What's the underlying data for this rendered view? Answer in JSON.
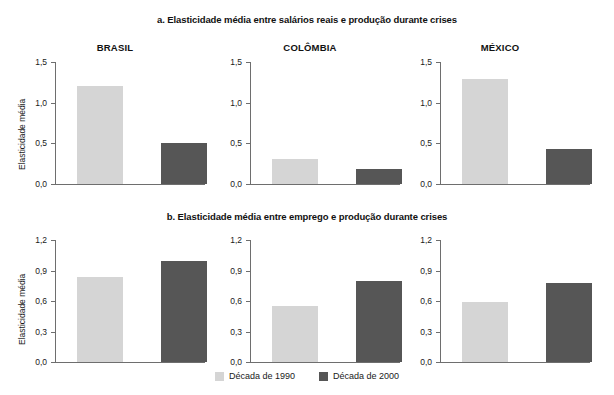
{
  "figure": {
    "legend": {
      "entries": [
        {
          "label": "Década de 1990",
          "color": "#d5d5d5",
          "key": "decada1990"
        },
        {
          "label": "Década de 2000",
          "color": "#565656",
          "key": "decada2000"
        }
      ]
    }
  },
  "chart_data": [
    {
      "type": "bar",
      "id": "panel-a-brasil",
      "title": "a. Elasticidade média entre salários reais e produção durante crises",
      "panel_title": "BRASIL",
      "xlabel": "",
      "ylabel": "Elasticidade média",
      "ylim": [
        0,
        1.5
      ],
      "yticks": [
        0,
        0.5,
        1.0,
        1.5
      ],
      "ytick_labels": [
        "0,0",
        "0,5",
        "1,0",
        "1,5"
      ],
      "grid": false,
      "categories": [
        "Década de 1990",
        "Década de 2000"
      ],
      "series": [
        {
          "name": "Década de 1990",
          "values": [
            1.2
          ],
          "color": "#d5d5d5"
        },
        {
          "name": "Década de 2000",
          "values": [
            0.5
          ],
          "color": "#565656"
        }
      ],
      "values": [
        1.2,
        0.5
      ]
    },
    {
      "type": "bar",
      "id": "panel-a-colombia",
      "title": "a. Elasticidade média entre salários reais e produção durante crises",
      "panel_title": "COLÔMBIA",
      "xlabel": "",
      "ylabel": "",
      "ylim": [
        0,
        1.5
      ],
      "yticks": [
        0,
        0.5,
        1.0,
        1.5
      ],
      "ytick_labels": [
        "0,0",
        "0,5",
        "1,0",
        "1,5"
      ],
      "grid": false,
      "categories": [
        "Década de 1990",
        "Década de 2000"
      ],
      "series": [
        {
          "name": "Década de 1990",
          "values": [
            0.31
          ],
          "color": "#d5d5d5"
        },
        {
          "name": "Década de 2000",
          "values": [
            0.18
          ],
          "color": "#565656"
        }
      ],
      "values": [
        0.31,
        0.18
      ]
    },
    {
      "type": "bar",
      "id": "panel-a-mexico",
      "title": "a. Elasticidade média entre salários reais e produção durante crises",
      "panel_title": "MÉXICO",
      "xlabel": "",
      "ylabel": "",
      "ylim": [
        0,
        1.5
      ],
      "yticks": [
        0,
        0.5,
        1.0,
        1.5
      ],
      "ytick_labels": [
        "0,0",
        "0,5",
        "1,0",
        "1,5"
      ],
      "grid": false,
      "categories": [
        "Década de 1990",
        "Década de 2000"
      ],
      "series": [
        {
          "name": "Década de 1990",
          "values": [
            1.29
          ],
          "color": "#d5d5d5"
        },
        {
          "name": "Década de 2000",
          "values": [
            0.43
          ],
          "color": "#565656"
        }
      ],
      "values": [
        1.29,
        0.43
      ]
    },
    {
      "type": "bar",
      "id": "panel-b-brasil",
      "title": "b. Elasticidade média entre emprego e produção durante crises",
      "panel_title": "",
      "xlabel": "",
      "ylabel": "Elasticidade média",
      "ylim": [
        0,
        1.2
      ],
      "yticks": [
        0,
        0.3,
        0.6,
        0.9,
        1.2
      ],
      "ytick_labels": [
        "0,0",
        "0,3",
        "0,6",
        "0,9",
        "1,2"
      ],
      "grid": false,
      "categories": [
        "Década de 1990",
        "Década de 2000"
      ],
      "series": [
        {
          "name": "Década de 1990",
          "values": [
            0.84
          ],
          "color": "#d5d5d5"
        },
        {
          "name": "Década de 2000",
          "values": [
            0.99
          ],
          "color": "#565656"
        }
      ],
      "values": [
        0.84,
        0.99
      ]
    },
    {
      "type": "bar",
      "id": "panel-b-colombia",
      "title": "b. Elasticidade média entre emprego e produção durante crises",
      "panel_title": "",
      "xlabel": "",
      "ylabel": "",
      "ylim": [
        0,
        1.2
      ],
      "yticks": [
        0,
        0.3,
        0.6,
        0.9,
        1.2
      ],
      "ytick_labels": [
        "0,0",
        "0,3",
        "0,6",
        "0,9",
        "1,2"
      ],
      "grid": false,
      "categories": [
        "Década de 1990",
        "Década de 2000"
      ],
      "series": [
        {
          "name": "Década de 1990",
          "values": [
            0.55
          ],
          "color": "#d5d5d5"
        },
        {
          "name": "Década de 2000",
          "values": [
            0.8
          ],
          "color": "#565656"
        }
      ],
      "values": [
        0.55,
        0.8
      ]
    },
    {
      "type": "bar",
      "id": "panel-b-mexico",
      "title": "b. Elasticidade média entre emprego e produção durante crises",
      "panel_title": "",
      "xlabel": "",
      "ylabel": "",
      "ylim": [
        0,
        1.2
      ],
      "yticks": [
        0,
        0.3,
        0.6,
        0.9,
        1.2
      ],
      "ytick_labels": [
        "0,0",
        "0,3",
        "0,6",
        "0,9",
        "1,2"
      ],
      "grid": false,
      "categories": [
        "Década de 1990",
        "Década de 2000"
      ],
      "series": [
        {
          "name": "Década de 1990",
          "values": [
            0.59
          ],
          "color": "#d5d5d5"
        },
        {
          "name": "Década de 2000",
          "values": [
            0.78
          ],
          "color": "#565656"
        }
      ],
      "values": [
        0.59,
        0.78
      ]
    }
  ]
}
